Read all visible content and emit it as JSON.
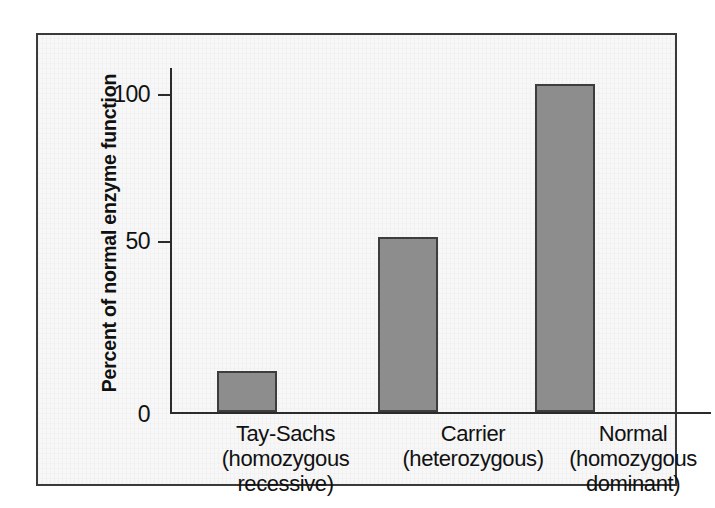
{
  "chart_data": {
    "type": "bar",
    "title": "",
    "xlabel": "",
    "ylabel": "Percent of normal enzyme function",
    "categories": [
      "Tay-Sachs\n(homozygous\nrecessive)",
      "Carrier\n(heterozygous)",
      "Normal\n(homozygous\ndominant)"
    ],
    "category_names": [
      "Tay-Sachs",
      "Carrier",
      "Normal"
    ],
    "category_sublabels": [
      "(homozygous recessive)",
      "(heterozygous)",
      "(homozygous dominant)"
    ],
    "values": [
      13,
      55,
      103
    ],
    "ylim": [
      0,
      110
    ],
    "yticks": [
      0,
      50,
      100
    ],
    "ytick_labels": [
      "0",
      "50",
      "100"
    ],
    "grid": false,
    "legend": false,
    "bar_color": "#8d8d8d",
    "bar_border_color": "#3d3d3d",
    "axis_color": "#2b2b2b",
    "background_color": "#f7f7f7",
    "frame_border_color": "#3a3a3a"
  }
}
